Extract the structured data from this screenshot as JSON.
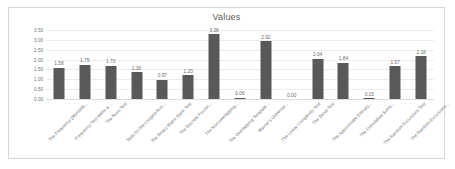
{
  "chart_data": {
    "type": "bar",
    "title": "Values",
    "xlabel": "",
    "ylabel": "",
    "ylim": [
      0.0,
      3.5
    ],
    "yticks": [
      "0.00",
      "0.50",
      "1.00",
      "1.50",
      "2.00",
      "2.50",
      "3.00",
      "3.50"
    ],
    "grid": true,
    "legend": false,
    "bar_color": "#595959",
    "gridline_color": "#ededed",
    "categories": [
      "The Frequency (Monobit)...",
      "Frequency Test within a ...",
      "The Runs Test",
      "Tests for the Longest-Run...",
      "The Binary Matrix Rank Test",
      "The Discrete Fourier...",
      "The Non-overlapping...",
      "The Overlapping Template...",
      "Maurer's Universal...",
      "The Linear Complexity Test",
      "The Serial Test",
      "The Approximate Entropy...",
      "The Cumulative Sums...",
      "The Random Excursions Test",
      "The Random Excursions..."
    ],
    "values": [
      1.58,
      1.75,
      1.7,
      1.36,
      0.97,
      1.2,
      3.28,
      0.06,
      2.92,
      0.0,
      2.04,
      1.84,
      0.03,
      1.67,
      2.18
    ],
    "value_labels": [
      "1.58",
      "1.75",
      "1.70",
      "1.36",
      "0.97",
      "1.20",
      "3.28",
      "0.06",
      "2.92",
      "0.00",
      "2.04",
      "1.84",
      "0.03",
      "1.67",
      "2.18"
    ]
  }
}
